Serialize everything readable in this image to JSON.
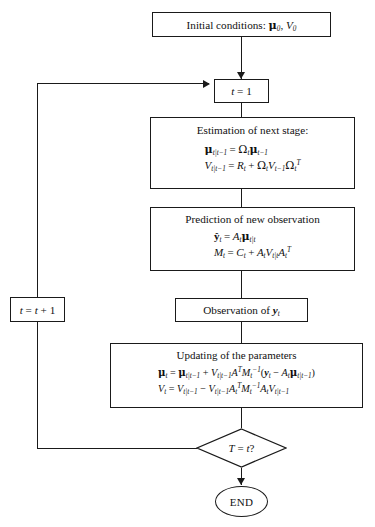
{
  "diagram": {
    "type": "flowchart"
  },
  "nodes": {
    "initial": {
      "name": "initial-conditions",
      "shape": "rect",
      "text": "Initial conditions: μ₀, V₀",
      "label_plain": "Initial conditions",
      "variables": [
        "μ0",
        "V0"
      ]
    },
    "t_init": {
      "name": "t-init",
      "shape": "rect",
      "text": "t = 1"
    },
    "estimation": {
      "name": "estimation-of-next-stage",
      "shape": "rect",
      "header": "Estimation of next stage:",
      "equations": [
        "μ_{t|t-1} = Ω_t μ_{t-1}",
        "V_{t|t-1} = R_t + Ω_t V_{t-1} Ω_t^T"
      ]
    },
    "prediction": {
      "name": "prediction-of-new-observation",
      "shape": "rect",
      "header": "Prediction of new observation",
      "equations": [
        "ŷ_t = A_t μ_{t|t-1}",
        "M_t = C_t + A_t V_{t|t-1} A_t^T"
      ]
    },
    "observation": {
      "name": "observation-of-y",
      "shape": "rect",
      "text": "Observation of y_t"
    },
    "updating": {
      "name": "updating-of-the-parameters",
      "shape": "rect",
      "header": "Updating of the parameters",
      "equations": [
        "μ_t = μ_{t|t-1} + V_{t|t-1} A^T M_t^{-1} (y_t − A_t μ_{t|t-1})",
        "V_t = V_{t|t-1} − V_{t|t-1} A_t^T M_t^{-1} A_t V_{t|t-1}"
      ]
    },
    "decision": {
      "name": "decision-T-equals-t",
      "shape": "diamond",
      "text": "T = t?"
    },
    "increment": {
      "name": "increment-t",
      "shape": "rect",
      "text": "t = t + 1"
    },
    "end": {
      "name": "end-terminator",
      "shape": "ellipse",
      "text": "END"
    }
  },
  "colors": {
    "stroke": "#1a1a1a",
    "background": "#ffffff",
    "text": "#111111"
  },
  "caption": {
    "text": ""
  }
}
